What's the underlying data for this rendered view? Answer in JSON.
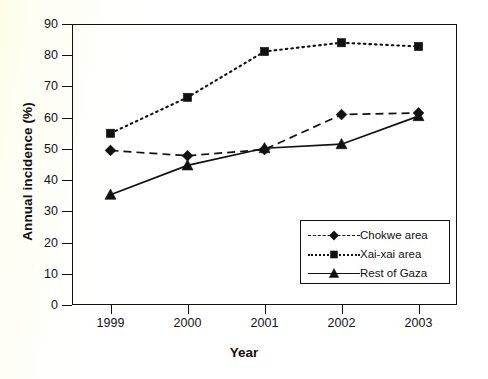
{
  "chart_data": {
    "type": "line",
    "title": "",
    "xlabel": "Year",
    "ylabel": "Annual incidence (%)",
    "categories": [
      "1999",
      "2000",
      "2001",
      "2002",
      "2003"
    ],
    "x": [
      1999,
      2000,
      2001,
      2002,
      2003
    ],
    "ylim": [
      0,
      90
    ],
    "xlim": [
      1998.5,
      2003.5
    ],
    "y_ticks": [
      "0",
      "10",
      "20",
      "30",
      "40",
      "50",
      "60",
      "70",
      "80",
      "90"
    ],
    "y_tick_values": [
      0,
      10,
      20,
      30,
      40,
      50,
      60,
      70,
      80,
      90
    ],
    "grid": false,
    "legend_position": "lower right (inside plot area)",
    "series": [
      {
        "name": "Chokwe area",
        "values": [
          49.5,
          47.8,
          49.8,
          61.0,
          61.5
        ],
        "marker": "diamond",
        "line_style": "dashed",
        "color": "#111111"
      },
      {
        "name": "Xai-xai area",
        "values": [
          55.0,
          66.5,
          81.2,
          84.0,
          82.8
        ],
        "marker": "square",
        "line_style": "dotted",
        "color": "#111111"
      },
      {
        "name": "Rest of Gaza",
        "values": [
          35.3,
          44.7,
          50.2,
          51.5,
          60.5
        ],
        "marker": "triangle",
        "line_style": "solid",
        "color": "#111111"
      }
    ]
  },
  "axes": {
    "y_title": "Annual incidence (%)",
    "x_title": "Year"
  },
  "legend": {
    "entries": [
      {
        "label": "Chokwe area",
        "marker": "diamond",
        "line_style": "dashed"
      },
      {
        "label": "Xai-xai area",
        "marker": "square",
        "line_style": "dotted"
      },
      {
        "label": "Rest of Gaza",
        "marker": "triangle",
        "line_style": "solid"
      }
    ]
  }
}
